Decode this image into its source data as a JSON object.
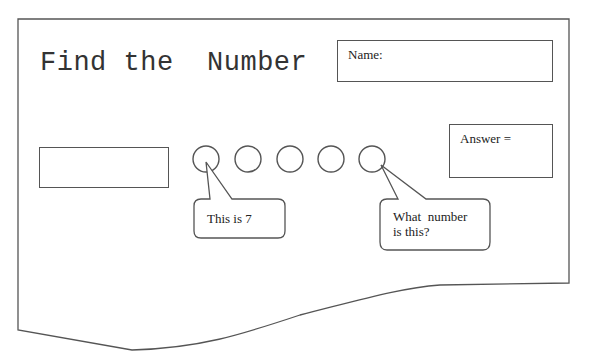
{
  "worksheet": {
    "title": "Find the  Number",
    "name_label": "Name:",
    "answer_label": "Answer =",
    "circles": [
      {
        "index": 1,
        "label": "circle-1"
      },
      {
        "index": 2,
        "label": "circle-2"
      },
      {
        "index": 3,
        "label": "circle-3"
      },
      {
        "index": 4,
        "label": "circle-4"
      },
      {
        "index": 5,
        "label": "circle-5"
      }
    ],
    "callouts": [
      {
        "text": "This is 7"
      },
      {
        "line1": "What  number",
        "line2": "is this?"
      }
    ]
  }
}
